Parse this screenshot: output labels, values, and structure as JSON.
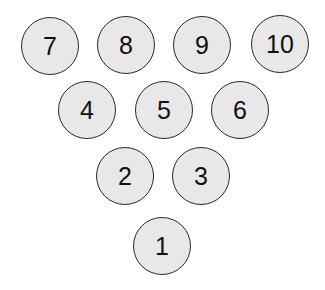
{
  "diagram": {
    "type": "bowling-pin-layout",
    "pins": [
      {
        "label": "7",
        "cx": 50,
        "cy": 46
      },
      {
        "label": "8",
        "cx": 126,
        "cy": 45
      },
      {
        "label": "9",
        "cx": 202,
        "cy": 45
      },
      {
        "label": "10",
        "cx": 280,
        "cy": 44
      },
      {
        "label": "4",
        "cx": 87,
        "cy": 110
      },
      {
        "label": "5",
        "cx": 164,
        "cy": 110
      },
      {
        "label": "6",
        "cx": 240,
        "cy": 110
      },
      {
        "label": "2",
        "cx": 125,
        "cy": 176
      },
      {
        "label": "3",
        "cx": 201,
        "cy": 176
      },
      {
        "label": "1",
        "cx": 162,
        "cy": 246
      }
    ],
    "colors": {
      "fill": "#e8e8e8",
      "stroke": "#2a2a2a",
      "text": "#111111",
      "background": "#ffffff"
    }
  }
}
